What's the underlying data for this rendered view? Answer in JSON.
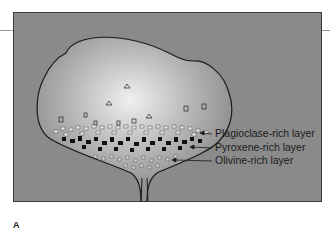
{
  "figure": {
    "letter": "A",
    "labels": [
      {
        "text": "Plagioclase-rich layer",
        "x": 215,
        "y": 133
      },
      {
        "text": "Pyroxene-rich layer",
        "x": 215,
        "y": 147
      },
      {
        "text": "Olivine-rich layer",
        "x": 215,
        "y": 160
      }
    ],
    "colors": {
      "background": "#8a8a8a",
      "chamber_light": "#e8e8e8",
      "chamber_dark": "#8f8f8f",
      "outline": "#1a1a1a",
      "crystal_dark": "#111111",
      "crystal_light": "#e6e6e6"
    }
  }
}
